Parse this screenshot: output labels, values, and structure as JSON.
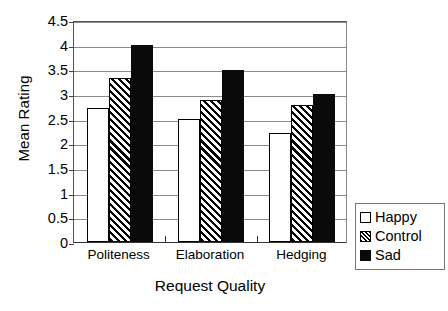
{
  "chart_data": {
    "type": "bar",
    "title": "",
    "xlabel": "Request Quality",
    "ylabel": "Mean Rating",
    "categories": [
      "Politeness",
      "Elaboration",
      "Hedging"
    ],
    "series": [
      {
        "name": "Happy",
        "values": [
          2.72,
          2.5,
          2.2
        ],
        "fill": "white",
        "color": "#ffffff"
      },
      {
        "name": "Control",
        "values": [
          3.33,
          2.87,
          2.78
        ],
        "fill": "hatch",
        "color": "#000000"
      },
      {
        "name": "Sad",
        "values": [
          4.0,
          3.48,
          3.0
        ],
        "fill": "solid",
        "color": "#0a0a0a"
      }
    ],
    "ylim": [
      0,
      4.5
    ],
    "ytick_labels": [
      "0",
      "0.5",
      "1",
      "1.5",
      "2",
      "2.5",
      "3",
      "3.5",
      "4",
      "4.5"
    ],
    "ytick_values": [
      0,
      0.5,
      1,
      1.5,
      2,
      2.5,
      3,
      3.5,
      4,
      4.5
    ],
    "grid": true,
    "legend_position": "right-bottom-outside"
  },
  "legend": {
    "items": [
      {
        "label": "Happy"
      },
      {
        "label": "Control"
      },
      {
        "label": "Sad"
      }
    ]
  }
}
